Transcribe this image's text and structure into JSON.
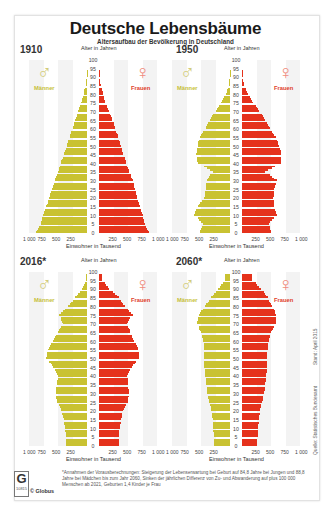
{
  "header": {
    "title": "Deutsche Lebensbäume",
    "subtitle": "Altersaufbau der Bevölkerung in Deutschland"
  },
  "labels": {
    "age_axis": "Alter in Jahren",
    "x_axis": "Einwohner in Tausend",
    "male": "Männer",
    "female": "Frauen",
    "male_symbol": "♂",
    "female_symbol": "♀",
    "age_ticks": [
      "100",
      "95",
      "90",
      "85",
      "80",
      "75",
      "70",
      "65",
      "60",
      "55",
      "50",
      "45",
      "40",
      "35",
      "30",
      "25",
      "20",
      "15",
      "10",
      "5",
      "0"
    ],
    "x_ticks_left": [
      "1 000",
      "750",
      "500",
      "250"
    ],
    "x_ticks_right": [
      "250",
      "500",
      "750",
      "1 000"
    ]
  },
  "side": {
    "stand": "Stand: April 2015",
    "quelle": "Quelle: Statistisches Bundesamt"
  },
  "footer": {
    "logo_letter": "G",
    "logo_number": "10815",
    "copyright": "© Globus",
    "footnote": "*Annahmen der Vorausberechnungen: Steigerung der Lebenserwartung bei Geburt auf 84,8 Jahre bei Jungen und 88,8 Jahre bei Mädchen bis zum Jahr 2060, Sinken der jährlichen Differenz von Zu- und Abwanderung auf plus 100 000 Menschen ab 2021, Geburten 1,4 Kinder je Frau"
  },
  "colors": {
    "male": "#c9c232",
    "female": "#e5321c",
    "background_columns": "#f3f3f3"
  },
  "chart_data": [
    {
      "type": "bar",
      "subtype": "population-pyramid",
      "title": "1910",
      "xlabel": "Einwohner in Tausend",
      "ylabel": "Alter in Jahren",
      "xlim": [
        -1000,
        1000
      ],
      "ylim": [
        0,
        100
      ],
      "age_groups": [
        0,
        5,
        10,
        15,
        20,
        25,
        30,
        35,
        40,
        45,
        50,
        55,
        60,
        65,
        70,
        75,
        80,
        85,
        90
      ],
      "series": [
        {
          "name": "Männer",
          "values": [
            880,
            800,
            760,
            700,
            650,
            600,
            560,
            500,
            450,
            400,
            350,
            300,
            250,
            200,
            150,
            100,
            60,
            25,
            5
          ]
        },
        {
          "name": "Frauen",
          "values": [
            860,
            790,
            750,
            700,
            660,
            620,
            580,
            520,
            470,
            420,
            380,
            330,
            280,
            230,
            170,
            110,
            70,
            30,
            8
          ]
        }
      ]
    },
    {
      "type": "bar",
      "subtype": "population-pyramid",
      "title": "1950",
      "xlabel": "Einwohner in Tausend",
      "ylabel": "Alter in Jahren",
      "xlim": [
        -1000,
        1000
      ],
      "ylim": [
        0,
        100
      ],
      "age_groups": [
        0,
        5,
        10,
        15,
        20,
        25,
        30,
        35,
        40,
        45,
        50,
        55,
        60,
        65,
        70,
        75,
        80,
        85,
        90
      ],
      "series": [
        {
          "name": "Männer",
          "values": [
            520,
            470,
            620,
            560,
            440,
            420,
            400,
            300,
            560,
            580,
            560,
            520,
            420,
            350,
            250,
            150,
            70,
            20,
            3
          ]
        },
        {
          "name": "Frauen",
          "values": [
            500,
            460,
            600,
            560,
            540,
            560,
            600,
            400,
            680,
            680,
            640,
            580,
            480,
            400,
            300,
            190,
            100,
            35,
            6
          ]
        }
      ]
    },
    {
      "type": "bar",
      "subtype": "population-pyramid",
      "title": "2016*",
      "xlabel": "Einwohner in Tausend",
      "ylabel": "Alter in Jahren",
      "xlim": [
        -1000,
        1000
      ],
      "ylim": [
        0,
        100
      ],
      "age_groups": [
        0,
        5,
        10,
        15,
        20,
        25,
        30,
        35,
        40,
        45,
        50,
        55,
        60,
        65,
        70,
        75,
        80,
        85,
        90,
        95
      ],
      "series": [
        {
          "name": "Männer",
          "values": [
            360,
            360,
            380,
            400,
            440,
            520,
            540,
            520,
            500,
            580,
            700,
            680,
            580,
            500,
            420,
            480,
            320,
            200,
            80,
            15
          ]
        },
        {
          "name": "Frauen",
          "values": [
            340,
            340,
            360,
            380,
            420,
            500,
            520,
            500,
            490,
            570,
            690,
            680,
            600,
            540,
            480,
            580,
            440,
            340,
            180,
            50
          ]
        }
      ]
    },
    {
      "type": "bar",
      "subtype": "population-pyramid",
      "title": "2060*",
      "xlabel": "Einwohner in Tausend",
      "ylabel": "Alter in Jahren",
      "xlim": [
        -1000,
        1000
      ],
      "ylim": [
        0,
        100
      ],
      "age_groups": [
        0,
        5,
        10,
        15,
        20,
        25,
        30,
        35,
        40,
        45,
        50,
        55,
        60,
        65,
        70,
        75,
        80,
        85,
        90,
        95
      ],
      "series": [
        {
          "name": "Männer",
          "values": [
            270,
            280,
            290,
            300,
            320,
            360,
            390,
            410,
            430,
            440,
            440,
            450,
            460,
            500,
            570,
            540,
            430,
            320,
            200,
            80
          ]
        },
        {
          "name": "Frauen",
          "values": [
            260,
            270,
            280,
            290,
            310,
            350,
            380,
            400,
            420,
            430,
            430,
            440,
            460,
            500,
            580,
            590,
            520,
            440,
            330,
            170
          ]
        }
      ]
    }
  ]
}
